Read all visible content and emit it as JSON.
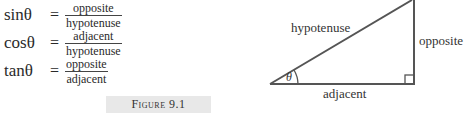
{
  "equations": [
    {
      "lhs": "sinθ",
      "eq": "=",
      "numerator": "opposite",
      "denominator": "hypotenuse"
    },
    {
      "lhs": "cosθ",
      "eq": "=",
      "numerator": "adjacent",
      "denominator": "hypotenuse"
    },
    {
      "lhs": "tanθ",
      "eq": "=",
      "numerator": "opposite",
      "denominator": "adjacent"
    }
  ],
  "caption": "Figure 9.1",
  "triangle": {
    "hypotenuse_label": "hypotenuse",
    "opposite_label": "opposite",
    "adjacent_label": "adjacent",
    "angle_label": "θ"
  }
}
